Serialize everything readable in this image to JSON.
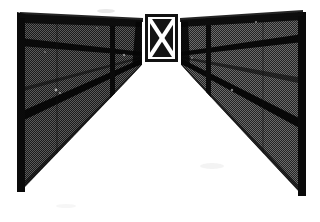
{
  "image": {
    "title": "Perspective view of converging dark walls toward central X-braced gate",
    "width": 320,
    "height": 222,
    "medium": "dithered black-and-white halftone photograph",
    "background_color": "#ffffff",
    "alt_text": "Two dark fence walls recede in perspective toward a small bright gate panel marked with a white X, with a white floor between them."
  },
  "palette": {
    "paper_white": "#ffffff",
    "floor_white": "#fdfdfd",
    "wall_dither_dark": "#1a1a1a",
    "wall_dither_light": "#585858",
    "frame_black": "#0d0d0d",
    "rail_black": "#000000",
    "panel_white": "#ffffff",
    "panel_black": "#111111",
    "shadow_gray": "#3a3a3a"
  },
  "geometry": {
    "vanishing_point": {
      "x": 161,
      "y": 64
    },
    "left_wall": {
      "name": "left-wall",
      "top_outer": {
        "x": 20,
        "y": 14
      },
      "top_inner": {
        "x": 143,
        "y": 20
      },
      "bottom_inner": {
        "x": 143,
        "y": 64
      },
      "bottom_outer": {
        "x": 20,
        "y": 192
      }
    },
    "right_wall": {
      "name": "right-wall",
      "top_inner": {
        "x": 180,
        "y": 20
      },
      "top_outer": {
        "x": 303,
        "y": 12
      },
      "bottom_outer": {
        "x": 303,
        "y": 196
      },
      "bottom_inner": {
        "x": 180,
        "y": 64
      }
    },
    "gate_panel": {
      "name": "gate-panel",
      "x": 142,
      "y": 11,
      "width": 39,
      "height": 54,
      "border_width": 3,
      "frame_width": 3
    },
    "floor": {
      "name": "floor-path",
      "apex": {
        "x": 161,
        "y": 64
      },
      "left_base": {
        "x": 20,
        "y": 222
      },
      "right_base": {
        "x": 303,
        "y": 222
      }
    }
  },
  "elements": {
    "left_post_label": "left-vertical-post",
    "right_post_label": "right-vertical-post",
    "top_beam_label": "top-beam",
    "gate_label": "x-braced-gate",
    "floor_label": "floor-path"
  },
  "features": {
    "left_rails": [
      {
        "name": "left-rail-upper",
        "from_y": 38,
        "to_y": 52
      },
      {
        "name": "left-rail-lower",
        "from_y": 112,
        "to_y": 60
      }
    ],
    "right_rails": [
      {
        "name": "right-rail-upper",
        "from_y": 34,
        "to_y": 52
      },
      {
        "name": "right-rail-lower",
        "from_y": 120,
        "to_y": 60
      }
    ],
    "left_posts": [
      {
        "name": "left-post-mid",
        "x": 112
      }
    ],
    "right_posts": [
      {
        "name": "right-post-mid",
        "x": 208
      }
    ]
  }
}
